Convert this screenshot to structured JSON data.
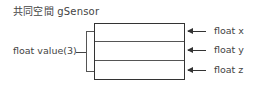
{
  "title": "共同空間 gSensor",
  "array_label": "float value(3)",
  "fields": [
    {
      "label": "float x"
    },
    {
      "label": "float y"
    },
    {
      "label": "float z"
    }
  ]
}
